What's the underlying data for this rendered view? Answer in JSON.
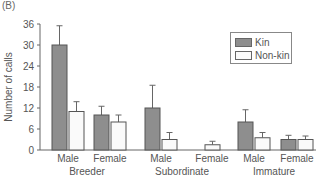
{
  "panel_label": "(B)",
  "colors": {
    "kin": "#8e8e8e",
    "non_kin": "#fafafa",
    "axis": "#666666"
  },
  "chart_data": {
    "type": "bar",
    "title": "",
    "xlabel": "",
    "ylabel": "Number of calls",
    "ylim": [
      0,
      36
    ],
    "yticks": [
      0,
      6,
      12,
      18,
      24,
      30,
      36
    ],
    "grid": false,
    "legend_position": "upper right",
    "groups": [
      "Breeder",
      "Subordinate",
      "Immature"
    ],
    "categories": [
      "Male",
      "Female",
      "Male",
      "Female",
      "Male",
      "Female"
    ],
    "category_groups": [
      "Breeder",
      "Breeder",
      "Subordinate",
      "Subordinate",
      "Immature",
      "Immature"
    ],
    "series": [
      {
        "name": "Kin",
        "values": [
          30,
          10,
          12,
          0,
          8,
          3
        ],
        "error_upper": [
          35.5,
          12.5,
          18.5,
          0,
          11.5,
          4.2
        ]
      },
      {
        "name": "Non-kin",
        "values": [
          11,
          8,
          3,
          1.5,
          3.5,
          3
        ],
        "error_upper": [
          13.8,
          10,
          5,
          2.5,
          5,
          4
        ]
      }
    ]
  },
  "legend": {
    "items": [
      {
        "label": "Kin"
      },
      {
        "label": "Non-kin"
      }
    ]
  }
}
